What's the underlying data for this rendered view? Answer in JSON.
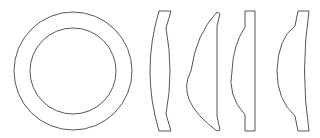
{
  "diagram": {
    "stroke_color": "#555555",
    "background": "#ffffff",
    "elements": [
      {
        "id": "ring-front-view",
        "shape": "annulus",
        "cx": 73,
        "cy": 71,
        "outer_r": 59,
        "inner_r": 43
      },
      {
        "id": "lens-biconvex-meniscus-profile",
        "shape": "lens-section",
        "x_range": [
          148,
          172
        ]
      },
      {
        "id": "lens-plano-convex-curved-profile",
        "shape": "lens-section",
        "x_range": [
          191,
          220
        ]
      },
      {
        "id": "lens-plano-convex-flanged-profile",
        "shape": "lens-section",
        "x_range": [
          232,
          255
        ]
      },
      {
        "id": "lens-meniscus-flanged-profile",
        "shape": "lens-section",
        "x_range": [
          277,
          309
        ]
      }
    ]
  }
}
